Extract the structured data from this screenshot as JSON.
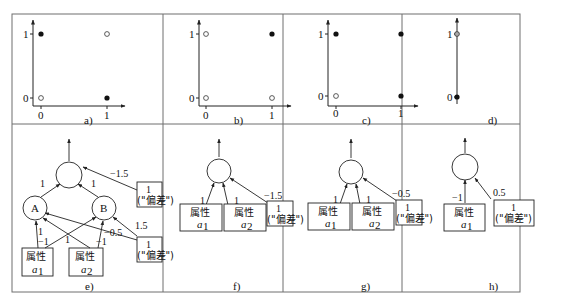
{
  "figure": {
    "panels_top": [
      {
        "id": "a",
        "caption": "a)",
        "title": "XOR",
        "x_ticks": [
          "0",
          "1"
        ],
        "y_ticks": [
          "0",
          "1"
        ],
        "points": [
          {
            "x": 0,
            "y": 1,
            "filled": true
          },
          {
            "x": 1,
            "y": 1,
            "filled": false
          },
          {
            "x": 0,
            "y": 0,
            "filled": false
          },
          {
            "x": 1,
            "y": 0,
            "filled": true
          }
        ]
      },
      {
        "id": "b",
        "caption": "b)",
        "title": "AND",
        "x_ticks": [
          "0",
          "1"
        ],
        "y_ticks": [
          "0",
          "1"
        ],
        "points": [
          {
            "x": 0,
            "y": 1,
            "filled": false
          },
          {
            "x": 1,
            "y": 1,
            "filled": true
          },
          {
            "x": 0,
            "y": 0,
            "filled": false
          },
          {
            "x": 1,
            "y": 0,
            "filled": false
          }
        ]
      },
      {
        "id": "c",
        "caption": "c)",
        "title": "OR",
        "x_ticks": [
          "0",
          "1"
        ],
        "y_ticks": [
          "0",
          "1"
        ],
        "points": [
          {
            "x": 0,
            "y": 1,
            "filled": true
          },
          {
            "x": 1,
            "y": 1,
            "filled": true
          },
          {
            "x": 0,
            "y": 0,
            "filled": false
          },
          {
            "x": 1,
            "y": 0,
            "filled": true
          }
        ]
      },
      {
        "id": "d",
        "caption": "d)",
        "title": "NOT",
        "y_ticks": [
          "0",
          "1"
        ],
        "points": [
          {
            "y": 1,
            "filled": false
          },
          {
            "y": 0,
            "filled": true
          }
        ]
      }
    ],
    "panels_bottom": [
      {
        "id": "e",
        "caption": "e)",
        "hidden_nodes": [
          "A",
          "B"
        ],
        "inputs": [
          {
            "label": "属性",
            "sub": "a",
            "subscript": "1"
          },
          {
            "label": "属性",
            "sub": "a",
            "subscript": "2"
          }
        ],
        "bias_label": "1",
        "bias_sub": "(\"偏差\")",
        "weights": {
          "a1_A": "1",
          "a1_B": "−1",
          "a2_A": "1",
          "a2_B": "−1",
          "bias2_A": "−0.5",
          "bias2_B": "1.5",
          "A_out": "1",
          "B_out": "1",
          "bias1_out": "−1.5"
        }
      },
      {
        "id": "f",
        "caption": "f)",
        "inputs": [
          {
            "label": "属性",
            "sub": "a",
            "subscript": "1"
          },
          {
            "label": "属性",
            "sub": "a",
            "subscript": "2"
          }
        ],
        "bias_label": "1",
        "bias_sub": "(\"偏差\")",
        "weights": {
          "a1": "1",
          "a2": "1",
          "bias": "−1.5"
        }
      },
      {
        "id": "g",
        "caption": "g)",
        "inputs": [
          {
            "label": "属性",
            "sub": "a",
            "subscript": "1"
          },
          {
            "label": "属性",
            "sub": "a",
            "subscript": "2"
          }
        ],
        "bias_label": "1",
        "bias_sub": "(\"偏差\")",
        "weights": {
          "a1": "1",
          "a2": "1",
          "bias": "−0.5"
        }
      },
      {
        "id": "h",
        "caption": "h)",
        "inputs": [
          {
            "label": "属性",
            "sub": "a",
            "subscript": "1"
          }
        ],
        "bias_label": "1",
        "bias_sub": "(\"偏差\")",
        "weights": {
          "a1": "−1",
          "bias": "0.5"
        }
      }
    ]
  }
}
